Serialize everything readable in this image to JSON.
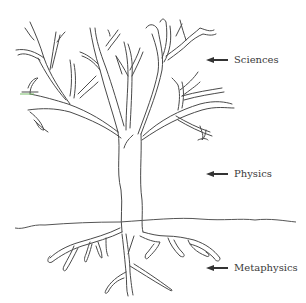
{
  "diagram": {
    "labels": [
      {
        "text": "Sciences",
        "arrow": "left-arrow"
      },
      {
        "text": "Physics",
        "arrow": "left-arrow"
      },
      {
        "text": "Metaphysics",
        "arrow": "left-arrow"
      }
    ],
    "parts": {
      "branches": "Sciences",
      "trunk": "Physics",
      "roots": "Metaphysics"
    },
    "colors": {
      "line": "#4a4a4a",
      "text": "#3a3a3a",
      "background": "#ffffff",
      "accent_mark": "#7bbf6a"
    }
  }
}
